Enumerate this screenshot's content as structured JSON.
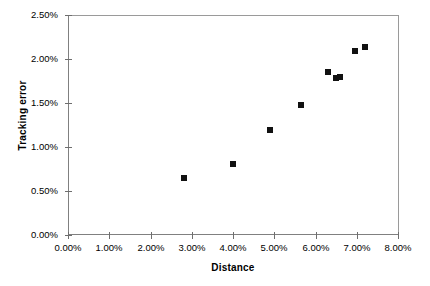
{
  "chart_data": {
    "type": "scatter",
    "title": "",
    "xlabel": "Distance",
    "ylabel": "Tracking error",
    "xlim": [
      0,
      8
    ],
    "ylim": [
      0,
      2.5
    ],
    "grid": false,
    "legend": null,
    "x_tick_labels": [
      "0.00%",
      "1.00%",
      "2.00%",
      "3.00%",
      "4.00%",
      "5.00%",
      "6.00%",
      "7.00%",
      "8.00%"
    ],
    "x_tick_values": [
      0,
      1,
      2,
      3,
      4,
      5,
      6,
      7,
      8
    ],
    "y_tick_labels": [
      "0.00%",
      "0.50%",
      "1.00%",
      "1.50%",
      "2.00%",
      "2.50%"
    ],
    "y_tick_values": [
      0,
      0.5,
      1.0,
      1.5,
      2.0,
      2.5
    ],
    "marker": "filled-square",
    "marker_color": "#111111",
    "axis_color": "#808080",
    "series": [
      {
        "name": "",
        "points": [
          {
            "x": 2.82,
            "y": 0.65
          },
          {
            "x": 4.0,
            "y": 0.81
          },
          {
            "x": 4.9,
            "y": 1.19
          },
          {
            "x": 5.65,
            "y": 1.48
          },
          {
            "x": 6.3,
            "y": 1.85
          },
          {
            "x": 6.5,
            "y": 1.78
          },
          {
            "x": 6.6,
            "y": 1.8
          },
          {
            "x": 6.95,
            "y": 2.09
          },
          {
            "x": 7.2,
            "y": 2.14
          }
        ]
      }
    ]
  }
}
